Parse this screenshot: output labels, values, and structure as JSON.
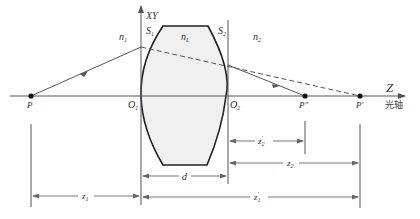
{
  "diagram": {
    "labels": {
      "axis_xy": "XY",
      "axis_z": "Z",
      "optical_axis": "光轴",
      "n1": "n",
      "n1_sub": "1",
      "nL": "n",
      "nL_sub": "L",
      "n2": "n",
      "n2_sub": "2",
      "S1": "S",
      "S1_sub": "1",
      "S2": "S",
      "S2_sub": "2",
      "O1": "O",
      "O1_sub": "1",
      "O2": "O",
      "O2_sub": "2",
      "P": "P",
      "P_double_prime": "P″",
      "P_prime": "P′"
    },
    "dimensions": {
      "d": "d",
      "z1": "z",
      "z1_sub": "1",
      "z1_prime": "z",
      "z1_prime_sub": "1",
      "z1_prime_sup": "′",
      "z2": "z",
      "z2_sub": "2",
      "z2_prime": "z",
      "z2_prime_sub": "2",
      "z2_prime_sup": "′"
    },
    "colors": {
      "line": "#555555",
      "lens_fill": "#f0f0f0",
      "lens_edge": "#222222",
      "point": "#111111"
    }
  }
}
